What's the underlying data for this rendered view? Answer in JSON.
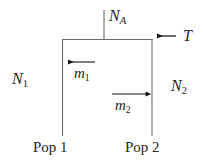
{
  "figure": {
    "type": "two-population-migration-diagram",
    "background_color": "#ffffff",
    "line_color": "#5a5a5a",
    "arrow_color": "#111111",
    "text_color": "#262626",
    "width": 203,
    "height": 167
  },
  "labels": {
    "ancestral_population": {
      "symbol": "N",
      "subscript": "A",
      "text": "N_A"
    },
    "divergence_time": {
      "symbol": "T",
      "subscript": "",
      "text": "T"
    },
    "population1_size": {
      "symbol": "N",
      "subscript": "1",
      "text": "N_1"
    },
    "population2_size": {
      "symbol": "N",
      "subscript": "2",
      "text": "N_2"
    },
    "migration_rate_1": {
      "symbol": "m",
      "subscript": "1",
      "text": "m_1"
    },
    "migration_rate_2": {
      "symbol": "m",
      "subscript": "2",
      "text": "m_2"
    },
    "population1_name": "Pop 1",
    "population2_name": "Pop 2"
  },
  "geometry": {
    "box": {
      "left_x": 62,
      "right_x": 152,
      "top_y": 39,
      "bottom_y": 135
    },
    "ancestral_stem": {
      "x": 104,
      "y_top": 10,
      "y_bottom": 39
    },
    "arrow_T": {
      "x_start": 176,
      "x_end": 153,
      "y": 36,
      "direction": "left"
    },
    "arrow_m1": {
      "x_start": 95,
      "x_end": 63,
      "y": 62,
      "direction": "left"
    },
    "arrow_m2": {
      "x_start": 112,
      "x_end": 151,
      "y": 94,
      "direction": "right"
    }
  }
}
